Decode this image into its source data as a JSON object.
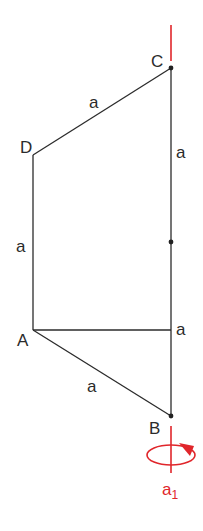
{
  "diagram": {
    "points": {
      "C": {
        "label": "C",
        "x": 171,
        "y": 68
      },
      "D": {
        "label": "D",
        "x": 33,
        "y": 155
      },
      "A": {
        "label": "A",
        "x": 33,
        "y": 330
      },
      "B": {
        "label": "B",
        "x": 171,
        "y": 416
      },
      "M": {
        "x": 171,
        "y": 242
      }
    },
    "edge_labels": {
      "CD": "a",
      "DA": "a",
      "AB": "a",
      "C_upper": "a",
      "A_horizontal": "a"
    },
    "axis": {
      "label": "a",
      "subscript": "1",
      "color": "#e0262b"
    },
    "line_color": "#2b2b2b"
  }
}
